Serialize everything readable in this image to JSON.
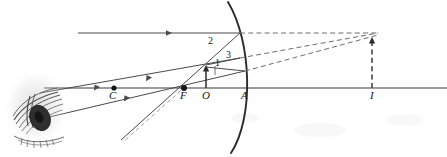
{
  "figure": {
    "type": "ray-diagram",
    "width": 447,
    "height": 157,
    "background_color": "#ffffff",
    "ink_color": "#2b2b2b",
    "line_color_light": "#6d6d6d"
  },
  "labels": {
    "center_of_curvature": "C",
    "focal_point": "F",
    "object_point": "O",
    "mirror_vertex": "A",
    "image_point": "I",
    "ray_one": "1",
    "ray_two": "2",
    "ray_three": "3"
  },
  "label_positions": {
    "C": {
      "x": 109,
      "y": 90
    },
    "F": {
      "x": 180,
      "y": 90
    },
    "O": {
      "x": 202,
      "y": 90
    },
    "A": {
      "x": 241,
      "y": 90
    },
    "I": {
      "x": 369,
      "y": 90
    },
    "1": {
      "x": 214,
      "y": 60
    },
    "2": {
      "x": 209,
      "y": 37
    },
    "3": {
      "x": 226,
      "y": 51
    }
  },
  "elements": {
    "principal_axis": {
      "name": "principal-axis",
      "x1": 44,
      "y1": 88,
      "x2": 447,
      "y2": 88
    },
    "mirror": {
      "name": "convex-mirror-arc",
      "vertex": {
        "x": 246,
        "y": 88
      },
      "top": {
        "x": 228,
        "y": 2
      },
      "bottom": {
        "x": 231,
        "y": 153
      },
      "curvature": "convex-toward-object"
    },
    "object_arrow": {
      "name": "object-arrow",
      "base": {
        "x": 206,
        "y": 88
      },
      "tip": {
        "x": 206,
        "y": 66
      },
      "style": "solid"
    },
    "image_arrow": {
      "name": "image-arrow",
      "base": {
        "x": 372,
        "y": 88
      },
      "tip": {
        "x": 372,
        "y": 38
      },
      "style": "dashed"
    },
    "markers": [
      {
        "name": "point-C-dot",
        "x": 114,
        "y": 88
      },
      {
        "name": "point-F-dot",
        "x": 184,
        "y": 88
      }
    ],
    "convergence_point": {
      "name": "image-convergence-point",
      "x": 371,
      "y": 34
    }
  },
  "rays": [
    {
      "name": "ray-1-parallel-incident",
      "label": "2",
      "style": "solid",
      "path": "78,33 240,33",
      "description": "incident ray parallel to principal axis"
    },
    {
      "name": "ray-1-reflected",
      "style": "solid",
      "path": "240,33 121,140",
      "description": "reflected ray diverging, appears to come from F"
    },
    {
      "name": "ray-1-virtual-extension",
      "style": "dashed",
      "path": "240,33 371,33",
      "description": "virtual extension behind mirror to image point"
    },
    {
      "name": "ray-2-incident-toward-F",
      "style": "solid",
      "path": "206,66 238,58",
      "description": "incident ray directed toward focal point F"
    },
    {
      "name": "ray-2-reflected",
      "style": "solid",
      "path": "238,58 40,93",
      "description": "reflected ray emerging parallel to axis toward eye"
    },
    {
      "name": "ray-2-virtual-extension",
      "style": "dashed",
      "path": "238,58 371,34",
      "description": "virtual extension behind mirror to image point"
    },
    {
      "name": "ray-3-incident-toward-C",
      "style": "solid",
      "path": "206,66 243,70",
      "description": "incident ray directed toward center of curvature C"
    },
    {
      "name": "ray-3-reflected",
      "style": "solid",
      "path": "243,70 45,118",
      "description": "reflected ray retracing along line through C"
    },
    {
      "name": "ray-3-virtual-extension",
      "style": "dashed",
      "path": "243,70 371,36",
      "description": "virtual extension behind mirror to image point"
    },
    {
      "name": "construction-line-through-F",
      "style": "dashed",
      "path": "184,88 124,142",
      "description": "faint construction line through focal point"
    }
  ],
  "observer": {
    "name": "eye",
    "x": 10,
    "y": 70,
    "width": 58,
    "height": 78,
    "description": "sketched human eye viewing reflected rays"
  }
}
